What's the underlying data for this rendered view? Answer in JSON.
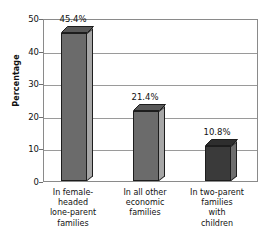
{
  "chart_data": {
    "type": "bar",
    "title": "",
    "xlabel": "",
    "ylabel": "Percentage",
    "ylim": [
      0,
      50
    ],
    "ytick_values": [
      0,
      10,
      20,
      30,
      40,
      50
    ],
    "ytick_labels": [
      "0",
      "10",
      "20",
      "30",
      "40",
      "50"
    ],
    "grid": true,
    "legend": false,
    "categories": [
      "In female-headed lone-parent families",
      "In all other economic families",
      "In two-parent families with children"
    ],
    "category_lines": [
      [
        "In female-",
        "headed",
        "lone-parent",
        "families"
      ],
      [
        "In all other",
        "economic",
        "families"
      ],
      [
        "In two-parent",
        "families",
        "with",
        "children"
      ]
    ],
    "values": [
      45.4,
      21.4,
      10.8
    ],
    "data_labels": [
      "45.4%",
      "21.4%",
      "10.8%"
    ],
    "bar_colors": [
      "#6b6b6b",
      "#6b6b6b",
      "#3a3a3a"
    ],
    "bar_side_colors": [
      "#a6a6a6",
      "#a6a6a6",
      "#6e6e6e"
    ],
    "bar_top_colors": [
      "#585858",
      "#585858",
      "#2e2e2e"
    ],
    "axis_color": "#8a8a8a",
    "grid_color": "#9a9a9a",
    "text_color": "#111111",
    "background": "#ffffff"
  }
}
